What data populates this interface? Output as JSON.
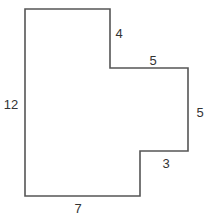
{
  "figure": {
    "type": "rectilinear-polygon",
    "stroke_color": "#555555",
    "label_color": "#333333",
    "vertices": [
      [
        25,
        9
      ],
      [
        110,
        9
      ],
      [
        110,
        68
      ],
      [
        188,
        68
      ],
      [
        188,
        151
      ],
      [
        140,
        151
      ],
      [
        140,
        196
      ],
      [
        25,
        196
      ]
    ],
    "side_labels": [
      {
        "id": "left",
        "text": "12",
        "x": 11,
        "y": 104
      },
      {
        "id": "top-step",
        "text": "4",
        "x": 119,
        "y": 33
      },
      {
        "id": "mid-top",
        "text": "5",
        "x": 153,
        "y": 60
      },
      {
        "id": "right",
        "text": "5",
        "x": 200,
        "y": 112
      },
      {
        "id": "lower-step",
        "text": "3",
        "x": 166,
        "y": 163
      },
      {
        "id": "bottom",
        "text": "7",
        "x": 78,
        "y": 208
      }
    ]
  }
}
